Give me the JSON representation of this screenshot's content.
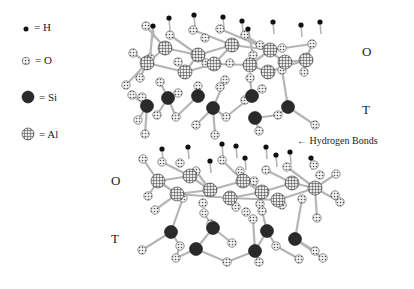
{
  "legend": [
    {
      "symbol": "H",
      "label": "= H",
      "x": 26,
      "y": 25,
      "type": "h"
    },
    {
      "symbol": "O",
      "label": "= O",
      "x": 26,
      "y": 57,
      "type": "o"
    },
    {
      "symbol": "Si",
      "label": "= Si",
      "x": 24,
      "y": 93,
      "type": "si"
    },
    {
      "symbol": "Al",
      "label": "= Al",
      "x": 24,
      "y": 130,
      "type": "al"
    }
  ],
  "labels": {
    "upper_O": "O",
    "upper_T": "T",
    "hydrogen_bonds": "← Hydrogen Bonds",
    "lower_O": "O",
    "lower_T": "T"
  },
  "colors": {
    "bond": "#b5b5b5",
    "si": "#222222",
    "h": "#111111",
    "o_fill": "#eeeeee",
    "al_fill": "#dddddd"
  },
  "layers": [
    {
      "name": "upper",
      "h": [
        [
          169,
          18
        ],
        [
          194,
          15
        ],
        [
          223,
          17
        ],
        [
          242,
          21
        ],
        [
          273,
          22
        ],
        [
          248,
          29
        ],
        [
          153,
          26
        ],
        [
          301,
          25
        ],
        [
          320,
          22
        ]
      ],
      "al": [
        [
          165,
          48
        ],
        [
          147,
          63
        ],
        [
          185,
          72
        ],
        [
          198,
          55
        ],
        [
          232,
          45
        ],
        [
          214,
          64
        ],
        [
          250,
          65
        ],
        [
          270,
          50
        ],
        [
          268,
          72
        ],
        [
          285,
          62
        ],
        [
          306,
          60
        ]
      ],
      "o": [
        [
          146,
          26
        ],
        [
          170,
          35
        ],
        [
          193,
          30
        ],
        [
          205,
          38
        ],
        [
          220,
          29
        ],
        [
          245,
          35
        ],
        [
          260,
          45
        ],
        [
          133,
          53
        ],
        [
          150,
          58
        ],
        [
          178,
          62
        ],
        [
          206,
          63
        ],
        [
          230,
          63
        ],
        [
          253,
          55
        ],
        [
          282,
          48
        ],
        [
          312,
          44
        ],
        [
          140,
          78
        ],
        [
          160,
          82
        ],
        [
          198,
          86
        ],
        [
          225,
          80
        ],
        [
          250,
          78
        ],
        [
          282,
          70
        ],
        [
          304,
          72
        ],
        [
          262,
          89
        ],
        [
          132,
          95
        ],
        [
          142,
          97
        ],
        [
          178,
          93
        ],
        [
          220,
          87
        ],
        [
          245,
          100
        ],
        [
          138,
          120
        ],
        [
          176,
          117
        ],
        [
          196,
          125
        ],
        [
          226,
          117
        ],
        [
          278,
          115
        ],
        [
          315,
          125
        ],
        [
          145,
          134
        ],
        [
          215,
          135
        ],
        [
          259,
          131
        ],
        [
          157,
          115
        ],
        [
          126,
          85
        ]
      ],
      "si": [
        [
          168,
          98
        ],
        [
          147,
          106
        ],
        [
          198,
          96
        ],
        [
          213,
          108
        ],
        [
          252,
          96
        ],
        [
          255,
          118
        ],
        [
          288,
          107
        ]
      ],
      "bonds": [
        [
          [
            146,
            26
          ],
          [
            165,
            48
          ]
        ],
        [
          [
            170,
            35
          ],
          [
            198,
            55
          ]
        ],
        [
          [
            193,
            30
          ],
          [
            232,
            45
          ]
        ],
        [
          [
            220,
            29
          ],
          [
            270,
            50
          ]
        ],
        [
          [
            245,
            35
          ],
          [
            285,
            62
          ]
        ],
        [
          [
            133,
            53
          ],
          [
            147,
            63
          ]
        ],
        [
          [
            147,
            63
          ],
          [
            185,
            72
          ]
        ],
        [
          [
            185,
            72
          ],
          [
            214,
            64
          ]
        ],
        [
          [
            214,
            64
          ],
          [
            250,
            65
          ]
        ],
        [
          [
            250,
            65
          ],
          [
            268,
            72
          ]
        ],
        [
          [
            268,
            72
          ],
          [
            306,
            60
          ]
        ],
        [
          [
            165,
            48
          ],
          [
            198,
            55
          ]
        ],
        [
          [
            198,
            55
          ],
          [
            232,
            45
          ]
        ],
        [
          [
            232,
            45
          ],
          [
            270,
            50
          ]
        ],
        [
          [
            270,
            50
          ],
          [
            312,
            44
          ]
        ],
        [
          [
            147,
            63
          ],
          [
            165,
            48
          ]
        ],
        [
          [
            185,
            72
          ],
          [
            198,
            55
          ]
        ],
        [
          [
            214,
            64
          ],
          [
            232,
            45
          ]
        ],
        [
          [
            250,
            65
          ],
          [
            270,
            50
          ]
        ],
        [
          [
            285,
            62
          ],
          [
            306,
            60
          ]
        ],
        [
          [
            160,
            82
          ],
          [
            168,
            98
          ]
        ],
        [
          [
            198,
            86
          ],
          [
            198,
            96
          ]
        ],
        [
          [
            225,
            80
          ],
          [
            213,
            108
          ]
        ],
        [
          [
            250,
            78
          ],
          [
            252,
            96
          ]
        ],
        [
          [
            282,
            70
          ],
          [
            288,
            107
          ]
        ],
        [
          [
            147,
            106
          ],
          [
            132,
            95
          ]
        ],
        [
          [
            147,
            106
          ],
          [
            138,
            120
          ]
        ],
        [
          [
            168,
            98
          ],
          [
            176,
            117
          ]
        ],
        [
          [
            198,
            96
          ],
          [
            176,
            117
          ]
        ],
        [
          [
            213,
            108
          ],
          [
            226,
            117
          ]
        ],
        [
          [
            252,
            96
          ],
          [
            226,
            117
          ]
        ],
        [
          [
            255,
            118
          ],
          [
            278,
            115
          ]
        ],
        [
          [
            255,
            118
          ],
          [
            259,
            131
          ]
        ],
        [
          [
            288,
            107
          ],
          [
            278,
            115
          ]
        ],
        [
          [
            288,
            107
          ],
          [
            315,
            125
          ]
        ],
        [
          [
            213,
            108
          ],
          [
            215,
            135
          ]
        ],
        [
          [
            147,
            106
          ],
          [
            145,
            134
          ]
        ],
        [
          [
            168,
            98
          ],
          [
            157,
            115
          ]
        ],
        [
          [
            213,
            108
          ],
          [
            196,
            125
          ]
        ],
        [
          [
            153,
            26
          ],
          [
            150,
            58
          ]
        ],
        [
          [
            248,
            29
          ],
          [
            253,
            55
          ]
        ],
        [
          [
            306,
            60
          ],
          [
            304,
            72
          ]
        ],
        [
          [
            140,
            78
          ],
          [
            147,
            63
          ]
        ],
        [
          [
            312,
            44
          ],
          [
            306,
            60
          ]
        ],
        [
          [
            126,
            85
          ],
          [
            147,
            63
          ]
        ]
      ]
    },
    {
      "name": "lower",
      "h": [
        [
          162,
          149
        ],
        [
          188,
          147
        ],
        [
          222,
          144
        ],
        [
          236,
          146
        ],
        [
          245,
          158
        ],
        [
          266,
          147
        ],
        [
          276,
          155
        ],
        [
          290,
          152
        ],
        [
          311,
          158
        ],
        [
          210,
          161
        ]
      ],
      "al": [
        [
          158,
          181
        ],
        [
          190,
          176
        ],
        [
          177,
          194
        ],
        [
          210,
          190
        ],
        [
          230,
          198
        ],
        [
          243,
          181
        ],
        [
          262,
          192
        ],
        [
          278,
          200
        ],
        [
          292,
          183
        ],
        [
          315,
          188
        ]
      ],
      "o": [
        [
          143,
          159
        ],
        [
          162,
          162
        ],
        [
          180,
          163
        ],
        [
          196,
          171
        ],
        [
          222,
          160
        ],
        [
          240,
          171
        ],
        [
          254,
          181
        ],
        [
          266,
          170
        ],
        [
          287,
          167
        ],
        [
          314,
          165
        ],
        [
          320,
          175
        ],
        [
          336,
          174
        ],
        [
          335,
          195
        ],
        [
          340,
          202
        ],
        [
          148,
          196
        ],
        [
          155,
          210
        ],
        [
          183,
          198
        ],
        [
          203,
          203
        ],
        [
          236,
          207
        ],
        [
          260,
          204
        ],
        [
          282,
          205
        ],
        [
          302,
          199
        ],
        [
          317,
          218
        ],
        [
          204,
          213
        ],
        [
          253,
          219
        ],
        [
          142,
          250
        ],
        [
          180,
          246
        ],
        [
          232,
          243
        ],
        [
          276,
          246
        ],
        [
          315,
          251
        ],
        [
          176,
          258
        ],
        [
          227,
          262
        ],
        [
          259,
          262
        ],
        [
          299,
          259
        ],
        [
          323,
          258
        ],
        [
          262,
          211
        ],
        [
          211,
          224
        ],
        [
          246,
          212
        ]
      ],
      "si": [
        [
          171,
          232
        ],
        [
          213,
          228
        ],
        [
          267,
          231
        ],
        [
          196,
          249
        ],
        [
          255,
          251
        ],
        [
          295,
          239
        ]
      ],
      "bonds": [
        [
          [
            143,
            159
          ],
          [
            158,
            181
          ]
        ],
        [
          [
            162,
            162
          ],
          [
            190,
            176
          ]
        ],
        [
          [
            196,
            171
          ],
          [
            210,
            190
          ]
        ],
        [
          [
            222,
            160
          ],
          [
            243,
            181
          ]
        ],
        [
          [
            240,
            171
          ],
          [
            262,
            192
          ]
        ],
        [
          [
            266,
            170
          ],
          [
            292,
            183
          ]
        ],
        [
          [
            287,
            167
          ],
          [
            315,
            188
          ]
        ],
        [
          [
            158,
            181
          ],
          [
            190,
            176
          ]
        ],
        [
          [
            177,
            194
          ],
          [
            210,
            190
          ]
        ],
        [
          [
            210,
            190
          ],
          [
            243,
            181
          ]
        ],
        [
          [
            230,
            198
          ],
          [
            262,
            192
          ]
        ],
        [
          [
            262,
            192
          ],
          [
            292,
            183
          ]
        ],
        [
          [
            278,
            200
          ],
          [
            315,
            188
          ]
        ],
        [
          [
            158,
            181
          ],
          [
            177,
            194
          ]
        ],
        [
          [
            190,
            176
          ],
          [
            210,
            190
          ]
        ],
        [
          [
            243,
            181
          ],
          [
            262,
            192
          ]
        ],
        [
          [
            292,
            183
          ],
          [
            315,
            188
          ]
        ],
        [
          [
            177,
            194
          ],
          [
            230,
            198
          ]
        ],
        [
          [
            230,
            198
          ],
          [
            278,
            200
          ]
        ],
        [
          [
            315,
            188
          ],
          [
            340,
            202
          ]
        ],
        [
          [
            315,
            188
          ],
          [
            336,
            174
          ]
        ],
        [
          [
            183,
            198
          ],
          [
            171,
            232
          ]
        ],
        [
          [
            204,
            213
          ],
          [
            213,
            228
          ]
        ],
        [
          [
            253,
            219
          ],
          [
            255,
            251
          ]
        ],
        [
          [
            262,
            211
          ],
          [
            267,
            231
          ]
        ],
        [
          [
            302,
            199
          ],
          [
            295,
            239
          ]
        ],
        [
          [
            171,
            232
          ],
          [
            142,
            250
          ]
        ],
        [
          [
            171,
            232
          ],
          [
            180,
            246
          ]
        ],
        [
          [
            213,
            228
          ],
          [
            232,
            243
          ]
        ],
        [
          [
            213,
            228
          ],
          [
            196,
            249
          ]
        ],
        [
          [
            267,
            231
          ],
          [
            276,
            246
          ]
        ],
        [
          [
            267,
            231
          ],
          [
            255,
            251
          ]
        ],
        [
          [
            295,
            239
          ],
          [
            315,
            251
          ]
        ],
        [
          [
            295,
            239
          ],
          [
            323,
            258
          ]
        ],
        [
          [
            196,
            249
          ],
          [
            176,
            258
          ]
        ],
        [
          [
            196,
            249
          ],
          [
            227,
            262
          ]
        ],
        [
          [
            255,
            251
          ],
          [
            227,
            262
          ]
        ],
        [
          [
            255,
            251
          ],
          [
            259,
            262
          ]
        ],
        [
          [
            299,
            259
          ],
          [
            276,
            246
          ]
        ],
        [
          [
            180,
            246
          ],
          [
            176,
            258
          ]
        ],
        [
          [
            148,
            196
          ],
          [
            158,
            181
          ]
        ],
        [
          [
            155,
            210
          ],
          [
            177,
            194
          ]
        ],
        [
          [
            282,
            205
          ],
          [
            278,
            200
          ]
        ],
        [
          [
            317,
            218
          ],
          [
            315,
            188
          ]
        ],
        [
          [
            236,
            207
          ],
          [
            230,
            198
          ]
        ],
        [
          [
            211,
            224
          ],
          [
            213,
            228
          ]
        ]
      ]
    }
  ]
}
